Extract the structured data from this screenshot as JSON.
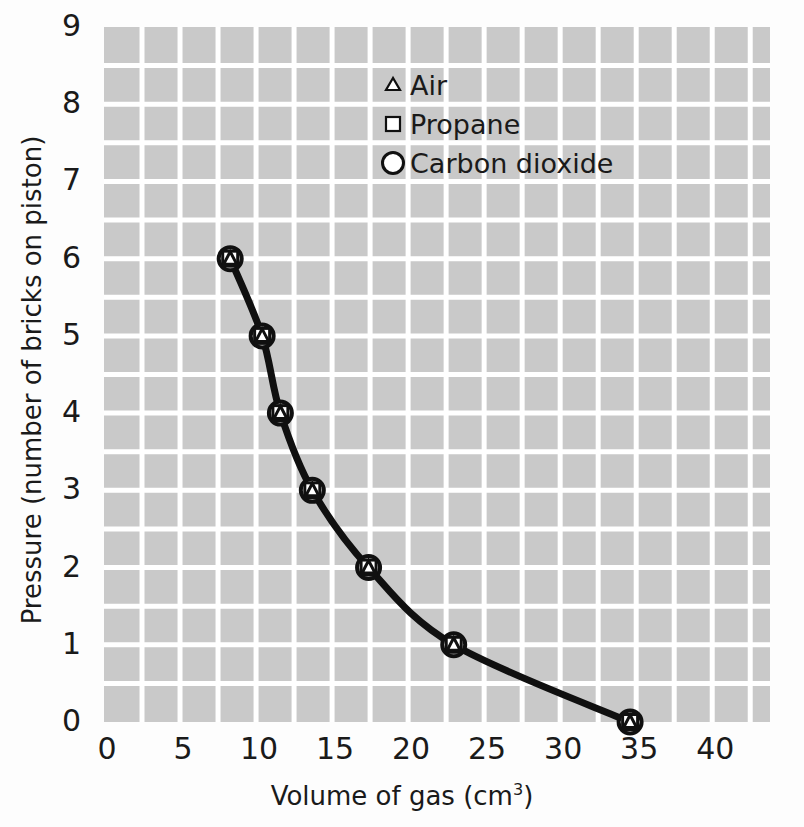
{
  "chart_data": {
    "type": "line",
    "title": "",
    "xlabel": "Volume of gas (cm3)",
    "xlabel_base": "Volume of gas (cm",
    "xlabel_sup": "3",
    "xlabel_tail": ")",
    "ylabel": "Pressure (number of bricks on piston)",
    "xlim": [
      0,
      43.8
    ],
    "ylim": [
      0,
      9
    ],
    "xticks": [
      0,
      5,
      10,
      15,
      20,
      25,
      30,
      35,
      40
    ],
    "xtick_labels": [
      "0",
      "5",
      "10",
      "15",
      "20",
      "25",
      "30",
      "35",
      "40"
    ],
    "yticks": [
      0,
      1,
      2,
      3,
      4,
      5,
      6,
      7,
      8,
      9
    ],
    "ytick_labels": [
      "0",
      "1",
      "2",
      "3",
      "4",
      "5",
      "6",
      "7",
      "8",
      "9"
    ],
    "grid": true,
    "grid_color": "#ffffff",
    "grid_x_step": 2.5,
    "grid_y_step": 0.5,
    "plot_bg": "#c9c9c9",
    "line_color": "#101010",
    "marker_color": "#101010",
    "legend_position": "upper-center",
    "x": [
      8.3,
      10.4,
      11.6,
      13.7,
      17.4,
      23.0,
      34.6
    ],
    "series": [
      {
        "name": "Air",
        "marker": "triangle",
        "values": [
          6,
          5,
          4,
          3,
          2,
          1,
          0
        ]
      },
      {
        "name": "Propane",
        "marker": "square",
        "values": [
          6,
          5,
          4,
          3,
          2,
          1,
          0
        ]
      },
      {
        "name": "Carbon dioxide",
        "marker": "circle",
        "values": [
          6,
          5,
          4,
          3,
          2,
          1,
          0
        ]
      }
    ],
    "points": [
      {
        "volume": 8.3,
        "pressure": 6
      },
      {
        "volume": 10.4,
        "pressure": 5
      },
      {
        "volume": 11.6,
        "pressure": 4
      },
      {
        "volume": 13.7,
        "pressure": 3
      },
      {
        "volume": 17.4,
        "pressure": 2
      },
      {
        "volume": 23.0,
        "pressure": 1
      },
      {
        "volume": 34.6,
        "pressure": 0
      }
    ]
  },
  "legend": {
    "items": [
      {
        "label": "Air",
        "marker": "triangle"
      },
      {
        "label": "Propane",
        "marker": "square"
      },
      {
        "label": "Carbon dioxide",
        "marker": "circle"
      }
    ]
  }
}
